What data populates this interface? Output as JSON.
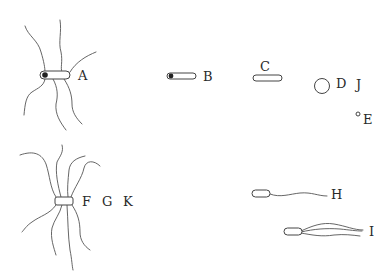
{
  "diagram": {
    "type": "bacterial-flagellation-arrangements",
    "labels": {
      "A": "A",
      "B": "B",
      "C": "C",
      "D": "D",
      "E": "E",
      "F": "F",
      "G": "G",
      "H": "H",
      "I": "I",
      "J": "J",
      "K": "K"
    },
    "items": [
      {
        "id": "A",
        "shape": "rod",
        "features": [
          "polar-granule",
          "peritrichous-flagella"
        ]
      },
      {
        "id": "B",
        "shape": "rod",
        "features": [
          "polar-granule"
        ]
      },
      {
        "id": "C",
        "shape": "rod",
        "features": []
      },
      {
        "id": "D",
        "shape": "coccus-large",
        "features": []
      },
      {
        "id": "J",
        "shape": "coccus-large",
        "features": []
      },
      {
        "id": "E",
        "shape": "coccus-small",
        "features": []
      },
      {
        "id": "F",
        "shape": "short-rod",
        "features": [
          "peritrichous-flagella"
        ]
      },
      {
        "id": "G",
        "shape": "short-rod",
        "features": [
          "peritrichous-flagella"
        ]
      },
      {
        "id": "K",
        "shape": "short-rod",
        "features": [
          "peritrichous-flagella"
        ]
      },
      {
        "id": "H",
        "shape": "rod",
        "features": [
          "monotrichous-flagellum"
        ]
      },
      {
        "id": "I",
        "shape": "rod",
        "features": [
          "lophotrichous-flagella"
        ]
      }
    ],
    "colors": {
      "stroke": "#444444",
      "text": "#2a2a2a",
      "background": "#ffffff"
    }
  }
}
